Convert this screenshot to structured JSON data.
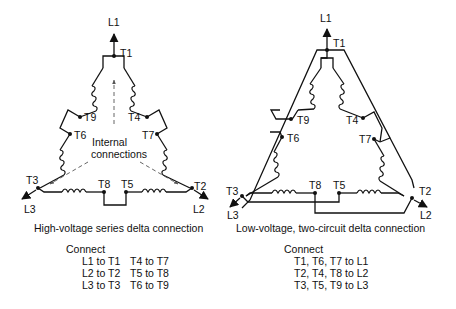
{
  "left_diagram": {
    "caption": "High-voltage series delta connection",
    "terminals": {
      "L1": "L1",
      "L2": "L2",
      "L3": "L3",
      "T1": "T1",
      "T2": "T2",
      "T3": "T3",
      "T4": "T4",
      "T5": "T5",
      "T6": "T6",
      "T7": "T7",
      "T8": "T8",
      "T9": "T9"
    },
    "annotation_line1": "Internal",
    "annotation_line2": "connections",
    "connect_title": "Connect",
    "connections": [
      [
        "L1 to T1",
        "T4 to T7"
      ],
      [
        "L2 to T2",
        "T5 to T8"
      ],
      [
        "L3 to T3",
        "T6 to T9"
      ]
    ]
  },
  "right_diagram": {
    "caption": "Low-voltage, two-circuit delta connection",
    "terminals": {
      "L1": "L1",
      "L2": "L2",
      "L3": "L3",
      "T1": "T1",
      "T2": "T2",
      "T3": "T3",
      "T4": "T4",
      "T5": "T5",
      "T6": "T6",
      "T7": "T7",
      "T8": "T8",
      "T9": "T9"
    },
    "connect_title": "Connect",
    "connections": [
      "T1, T6, T7 to L1",
      "T2, T4, T8 to L2",
      "T3, T5, T9 to L3"
    ]
  }
}
